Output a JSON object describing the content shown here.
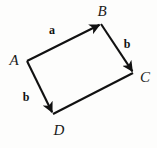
{
  "figure": {
    "type": "vector-parallelogram-diagram",
    "width": 157,
    "height": 148,
    "background_color": "#fdfdfc",
    "stroke_color": "#111111",
    "text_color": "#1a1a1a",
    "stroke_width": 2.1
  },
  "vertices": [
    {
      "id": "A",
      "label": "A",
      "point_x": 27,
      "point_y": 61,
      "label_x": 14,
      "label_y": 60
    },
    {
      "id": "B",
      "label": "B",
      "point_x": 101,
      "point_y": 24,
      "label_x": 102,
      "label_y": 11
    },
    {
      "id": "C",
      "label": "C",
      "point_x": 133,
      "point_y": 73,
      "label_x": 145,
      "label_y": 77
    },
    {
      "id": "D",
      "label": "D",
      "point_x": 53,
      "point_y": 114,
      "label_x": 59,
      "label_y": 130
    }
  ],
  "edges": [
    {
      "id": "AB",
      "from": "A",
      "to": "B",
      "arrow": true,
      "label": "a",
      "label_x": 52,
      "label_y": 30
    },
    {
      "id": "BC",
      "from": "B",
      "to": "C",
      "arrow": true,
      "label": "b",
      "label_x": 127,
      "label_y": 44
    },
    {
      "id": "AD",
      "from": "A",
      "to": "D",
      "arrow": true,
      "label": "b",
      "label_x": 26,
      "label_y": 97
    },
    {
      "id": "DC",
      "from": "D",
      "to": "C",
      "arrow": false,
      "label": "",
      "label_x": 0,
      "label_y": 0
    }
  ]
}
